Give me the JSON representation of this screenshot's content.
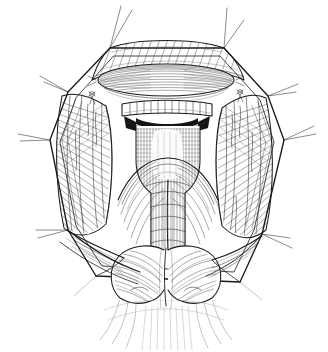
{
  "figure": {
    "kind": "line-art-illustration",
    "medium": "pen-and-ink-hatching",
    "caption": "",
    "title": "",
    "background_color": "#ffffff",
    "ink_color": "#1a1a1a",
    "dark_lumen_color": "#151515",
    "canvas": {
      "width": 328,
      "height": 352
    }
  },
  "scene": {
    "wound": {
      "name": "retracted-surgical-wound",
      "shape": "octagonal-skin-opening",
      "description": "Self-retaining retraction produces an eight-sided skin window through which the deep neck structures are exposed."
    },
    "retractor_spokes": {
      "name": "retractor-hooks",
      "count": 12,
      "description": "Paired fine wire hooks radiate outward from the wound vertices, tenting the skin edges apart."
    },
    "structures": [
      {
        "id": "superior-skin-flap",
        "label": "Superior skin and platysma flap",
        "position": "top",
        "shading": "oblique-hatch"
      },
      {
        "id": "elliptical-lobe",
        "label": "Retracted elliptical structure (thyroid isthmus / cricothyroid membrane region)",
        "position": "upper-center",
        "shading": "longitudinal-fine-hatch"
      },
      {
        "id": "ringed-band",
        "label": "Transverse ringed band with ladder-like rungs (cartilage rings / suture line)",
        "position": "center-upper",
        "rung_count": 12
      },
      {
        "id": "dark-lumen",
        "label": "Dark opening beneath the ringed band",
        "position": "center",
        "fill": "#151515"
      },
      {
        "id": "trachea",
        "label": "Central tracheal tube",
        "position": "center",
        "shading": "dense-vertical-stipple-and-cross-hatch"
      },
      {
        "id": "left-strap-muscle",
        "label": "Left strap muscle column",
        "position": "left-wall",
        "shading": "dense-oblique-hatch"
      },
      {
        "id": "right-strap-muscle",
        "label": "Right strap muscle column",
        "position": "right-wall",
        "shading": "dense-oblique-hatch"
      },
      {
        "id": "left-lobe",
        "label": "Left rounded lobe",
        "position": "bottom-left-of-center",
        "shading": "curved-contour-hatch"
      },
      {
        "id": "right-lobe",
        "label": "Right rounded lobe",
        "position": "bottom-right-of-center",
        "shading": "curved-contour-hatch"
      },
      {
        "id": "inferior-tissue",
        "label": "Inferior tissue planes fading toward the lower margin",
        "position": "bottom",
        "shading": "light-fading-strokes"
      }
    ]
  }
}
